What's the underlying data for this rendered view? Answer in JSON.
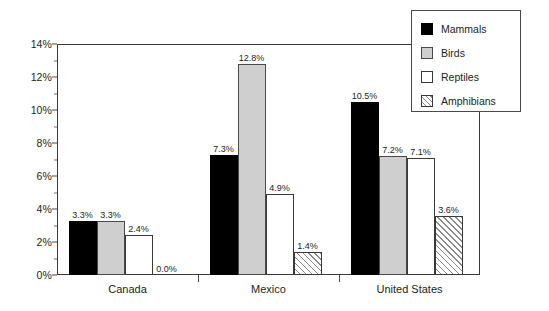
{
  "chart_data": {
    "type": "bar",
    "title": "",
    "subtitle": "",
    "xlabel": "",
    "ylabel": "",
    "categories": [
      "Canada",
      "Mexico",
      "United States"
    ],
    "series": [
      {
        "name": "Mammals",
        "color": "#000000",
        "fill": "solid-black",
        "values": [
          3.3,
          7.3,
          10.5
        ],
        "labels": [
          "3.3%",
          "7.3%",
          "10.5%"
        ]
      },
      {
        "name": "Birds",
        "color": "#cfcfcf",
        "fill": "solid-light-gray",
        "values": [
          3.3,
          12.8,
          7.2
        ],
        "labels": [
          "3.3%",
          "12.8%",
          "7.2%"
        ]
      },
      {
        "name": "Reptiles",
        "color": "#ffffff",
        "fill": "solid-white",
        "values": [
          2.4,
          4.9,
          7.1
        ],
        "labels": [
          "2.4%",
          "4.9%",
          "7.1%"
        ]
      },
      {
        "name": "Amphibians",
        "color": "#ffffff",
        "fill": "diagonal-hatch",
        "values": [
          0.0,
          1.4,
          3.6
        ],
        "labels": [
          "0.0%",
          "1.4%",
          "3.6%"
        ]
      }
    ],
    "ylim": [
      0,
      14
    ],
    "ytick_labels": [
      "0%",
      "2%",
      "4%",
      "6%",
      "8%",
      "10%",
      "12%",
      "14%"
    ],
    "ytick_values": [
      0,
      2,
      4,
      6,
      8,
      10,
      12,
      14
    ],
    "yminor_values": [
      1,
      3,
      5,
      7,
      9,
      11,
      13
    ],
    "grid": false,
    "legend_position": "top-right",
    "value_labels_shown": true,
    "axis_color": "#3a3a3a",
    "text_color": "#231f20",
    "background": "#ffffff"
  },
  "legend": {
    "entries": [
      {
        "label": "Mammals"
      },
      {
        "label": "Birds"
      },
      {
        "label": "Reptiles"
      },
      {
        "label": "Amphibians"
      }
    ]
  }
}
